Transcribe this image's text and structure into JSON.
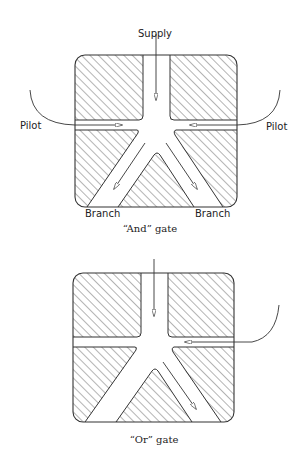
{
  "and_gate": {
    "caption": "“And” gate",
    "supply_label": "Supply",
    "pilot_left_label": "Pilot",
    "pilot_right_label": "Pilot",
    "branch_left_label": "Branch",
    "branch_right_label": "Branch"
  },
  "or_gate": {
    "caption": "“Or” gate"
  },
  "colors": {
    "line": "#333333",
    "hatch": "#444444",
    "background": "#ffffff"
  }
}
